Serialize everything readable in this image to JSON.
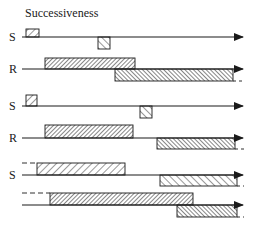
{
  "title": "Successiveness",
  "colors": {
    "ink": "#1a1a1a",
    "background": "#ffffff"
  },
  "groups": [
    {
      "name": "group-1",
      "rows": [
        {
          "label": "S",
          "line_y": 37,
          "bars": [
            {
              "x1": 26,
              "x2": 39,
              "side": "above",
              "height": 8,
              "hatch": "forward"
            },
            {
              "x1": 98,
              "x2": 110,
              "side": "below",
              "height": 12,
              "hatch": "backward"
            }
          ]
        },
        {
          "label": "R",
          "line_y": 69,
          "bars": [
            {
              "x1": 45,
              "x2": 135,
              "side": "above",
              "height": 11,
              "hatch": "forward-dense"
            },
            {
              "x1": 115,
              "x2": 233,
              "side": "below",
              "height": 12,
              "hatch": "backward-dense",
              "dashed_tail": true
            }
          ]
        }
      ]
    },
    {
      "name": "group-2",
      "rows": [
        {
          "label": "S",
          "line_y": 106,
          "bars": [
            {
              "x1": 26,
              "x2": 37,
              "side": "above",
              "height": 11,
              "hatch": "forward"
            },
            {
              "x1": 140,
              "x2": 152,
              "side": "below",
              "height": 12,
              "hatch": "backward"
            }
          ]
        },
        {
          "label": "R",
          "line_y": 138,
          "bars": [
            {
              "x1": 45,
              "x2": 133,
              "side": "above",
              "height": 13,
              "hatch": "forward-dense"
            },
            {
              "x1": 157,
              "x2": 235,
              "side": "below",
              "height": 11,
              "hatch": "backward-dense",
              "dashed_tail": true
            }
          ]
        }
      ]
    },
    {
      "name": "group-3",
      "rows": [
        {
          "label": "S",
          "line_y": 175,
          "bars": [
            {
              "x1": 37,
              "x2": 125,
              "side": "above",
              "height": 12,
              "hatch": "forward",
              "dashed_lead": true
            },
            {
              "x1": 160,
              "x2": 237,
              "side": "below",
              "height": 11,
              "hatch": "backward",
              "dashed_tail": true
            }
          ]
        },
        {
          "label": "",
          "line_y": 205,
          "bars": [
            {
              "x1": 50,
              "x2": 193,
              "side": "above",
              "height": 12,
              "hatch": "forward-dense",
              "dashed_lead": true
            },
            {
              "x1": 177,
              "x2": 237,
              "side": "below",
              "height": 12,
              "hatch": "backward-dense",
              "dashed_tail": true
            }
          ]
        }
      ]
    }
  ]
}
